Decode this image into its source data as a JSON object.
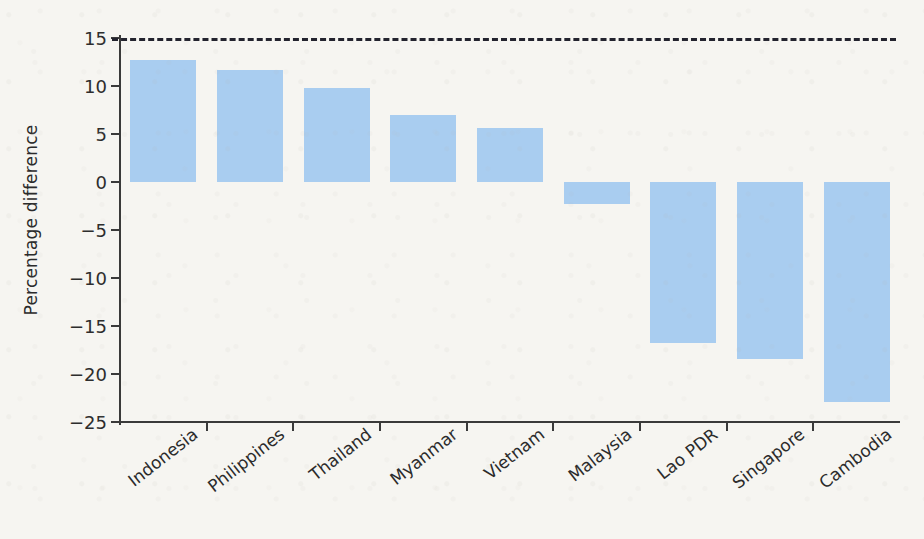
{
  "chart_data": {
    "type": "bar",
    "title": "",
    "subtitle": "",
    "xlabel": "",
    "ylabel": "Percentage difference",
    "categories": [
      "Indonesia",
      "Philippines",
      "Thailand",
      "Myanmar",
      "Vietnam",
      "Malaysia",
      "Lao PDR",
      "Singapore",
      "Cambodia"
    ],
    "values": [
      12.7,
      11.7,
      9.8,
      7.0,
      5.6,
      -2.3,
      -16.8,
      -18.4,
      -22.9
    ],
    "ylim": [
      -25,
      15
    ],
    "ytick_labels": [
      "15",
      "10",
      "5",
      "0",
      "−5",
      "−10",
      "−15",
      "−20",
      "−25"
    ],
    "ytick_values": [
      15,
      10,
      5,
      0,
      -5,
      -10,
      -15,
      -20,
      -25
    ],
    "grid": false,
    "legend": "none",
    "bar_color": "#a9cdf0",
    "zero_line": "dashed",
    "axis_color": "#3a3a3a",
    "background_color": "#f6f5f1"
  }
}
